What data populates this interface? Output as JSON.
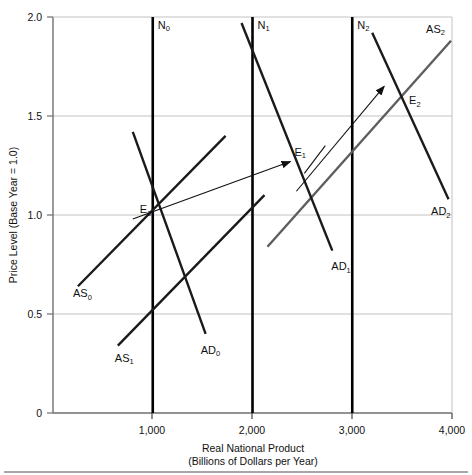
{
  "figure": {
    "background": "#ffffff",
    "plot": {
      "left": 53,
      "right": 452,
      "top": 17,
      "bottom": 413,
      "frame_color": "#6f6f6f",
      "grid_color": "#b9b9b9"
    },
    "colors": {
      "dark_line": "#1a1a1a",
      "gray_line": "#5e5e5e",
      "vertical_line": "#000000",
      "arrow": "#111111",
      "grid": "#bdbdbd",
      "frame": "#777777",
      "footer_rule": "#8a8a8a"
    }
  },
  "chart_data": {
    "type": "line",
    "title": "",
    "xlabel": "Real National Product",
    "xlabel_sub": "(Billions of Dollars per Year)",
    "ylabel": "Price Level (Base Year = 1.0)",
    "xlim": [
      0,
      4000
    ],
    "ylim": [
      0,
      2.0
    ],
    "xticks": [
      1000,
      2000,
      3000,
      4000
    ],
    "xtick_labels": [
      "1,000",
      "2,000",
      "3,000",
      "4,000"
    ],
    "yticks": [
      0,
      0.5,
      1.0,
      1.5,
      2.0
    ],
    "ytick_labels": [
      "0",
      "0.5",
      "1.0",
      "1.5",
      "2.0"
    ],
    "grid": true,
    "legend": "none",
    "series": [
      {
        "name": "N0",
        "label": "N₀",
        "kind": "vertical-potential-output",
        "x": 1000,
        "y_range": [
          0,
          2.0
        ],
        "style": "thick-black",
        "label_pos": {
          "x": 1000,
          "y": 1.94
        }
      },
      {
        "name": "N1",
        "label": "N₁",
        "kind": "vertical-potential-output",
        "x": 2000,
        "y_range": [
          0,
          2.0
        ],
        "style": "thick-black",
        "label_pos": {
          "x": 2000,
          "y": 1.94
        }
      },
      {
        "name": "N2",
        "label": "N₂",
        "kind": "vertical-potential-output",
        "x": 3000,
        "y_range": [
          0,
          2.0
        ],
        "style": "thick-black",
        "label_pos": {
          "x": 3000,
          "y": 1.94
        }
      },
      {
        "name": "AS0",
        "label": "AS₀",
        "kind": "aggregate-supply",
        "points": [
          [
            250,
            0.64
          ],
          [
            1730,
            1.4
          ]
        ],
        "style": "dark",
        "label_pos": {
          "x": 200,
          "y": 0.585
        }
      },
      {
        "name": "AS1",
        "label": "AS₁",
        "kind": "aggregate-supply",
        "points": [
          [
            650,
            0.34
          ],
          [
            2120,
            1.1
          ]
        ],
        "style": "dark",
        "label_pos": {
          "x": 620,
          "y": 0.26
        }
      },
      {
        "name": "AS2",
        "label": "AS₂",
        "kind": "aggregate-supply",
        "points": [
          [
            2150,
            0.84
          ],
          [
            3990,
            1.88
          ]
        ],
        "style": "gray",
        "label_pos": {
          "x": 3740,
          "y": 1.92
        }
      },
      {
        "name": "AD0",
        "label": "AD₀",
        "kind": "aggregate-demand",
        "points": [
          [
            800,
            1.42
          ],
          [
            1530,
            0.4
          ]
        ],
        "style": "dark",
        "label_pos": {
          "x": 1480,
          "y": 0.3
        }
      },
      {
        "name": "AD1",
        "label": "AD₁",
        "kind": "aggregate-demand",
        "points": [
          [
            1890,
            1.97
          ],
          [
            2800,
            0.82
          ]
        ],
        "style": "dark",
        "label_pos": {
          "x": 2790,
          "y": 0.72
        }
      },
      {
        "name": "AD2",
        "label": "AD₂",
        "kind": "aggregate-demand",
        "points": [
          [
            3200,
            1.92
          ],
          [
            3965,
            1.08
          ]
        ],
        "style": "dark",
        "label_pos": {
          "x": 3790,
          "y": 1.0
        }
      }
    ],
    "equilibria": [
      {
        "name": "E0",
        "label": "E₀",
        "x": 1000,
        "y": 1.0,
        "label_pos": {
          "x": 870,
          "y": 1.01
        }
      },
      {
        "name": "E1",
        "label": "E₁",
        "x": 2490,
        "y": 1.22,
        "label_pos": {
          "x": 2420,
          "y": 1.3
        }
      },
      {
        "name": "E2",
        "label": "E₂",
        "x": 3480,
        "y": 1.58,
        "label_pos": {
          "x": 3570,
          "y": 1.56
        }
      }
    ],
    "annotations": [
      {
        "name": "arrow-e0-to-e1",
        "kind": "arrow",
        "from": [
          800,
          0.98
        ],
        "to": [
          2380,
          1.27
        ]
      },
      {
        "name": "arrow-e1-to-e2",
        "kind": "arrow",
        "from": [
          2440,
          1.12
        ],
        "to": [
          3320,
          1.65
        ]
      },
      {
        "name": "tick-mark-e1",
        "kind": "short-segment",
        "from": [
          2520,
          1.21
        ],
        "to": [
          2730,
          1.35
        ]
      }
    ]
  },
  "footer": {
    "rule_visible": true
  }
}
